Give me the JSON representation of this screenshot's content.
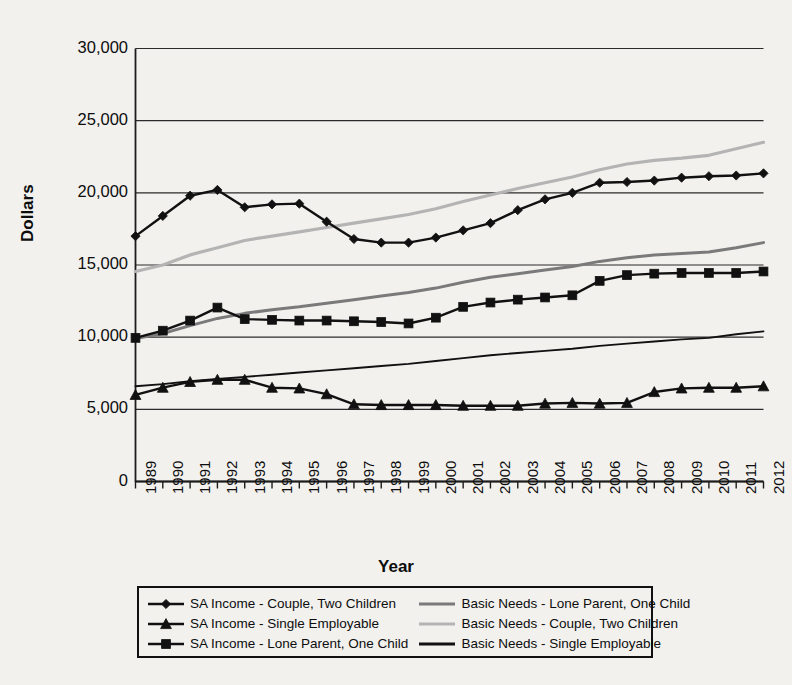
{
  "chart_data": {
    "type": "line",
    "title": "",
    "xlabel": "Year",
    "ylabel": "Dollars",
    "ylim": [
      0,
      30000
    ],
    "ytick_values": [
      30000,
      25000,
      20000,
      15000,
      10000,
      5000,
      0
    ],
    "ytick_labels": [
      "30,000",
      "25,000",
      "20,000",
      "15,000",
      "10,000",
      "5,000",
      "0"
    ],
    "grid": "horizontal",
    "legend_position": "bottom",
    "categories": [
      1989,
      1990,
      1991,
      1992,
      1993,
      1994,
      1995,
      1996,
      1997,
      1998,
      1999,
      2000,
      2001,
      2002,
      2003,
      2004,
      2005,
      2006,
      2007,
      2008,
      2009,
      2010,
      2011,
      2012
    ],
    "xtick_labels": [
      "1989",
      "1990",
      "1991",
      "1992",
      "1993",
      "1994",
      "1995",
      "1996",
      "1997",
      "1998",
      "1999",
      "2000",
      "2001",
      "2002",
      "2003",
      "2004",
      "2005",
      "2006",
      "2007",
      "2008",
      "2009",
      "2010",
      "2011",
      "2012"
    ],
    "series": [
      {
        "name": "SA Income - Couple, Two Children",
        "marker": "diamond",
        "color": "#111111",
        "width": 2.4,
        "values": [
          17000,
          18400,
          19800,
          20200,
          19000,
          19200,
          19250,
          18000,
          16800,
          16550,
          16550,
          16900,
          17400,
          17900,
          18800,
          19550,
          20000,
          20700,
          20750,
          20850,
          21050,
          21150,
          21200,
          21350
        ]
      },
      {
        "name": "SA Income - Single Employable",
        "marker": "triangle",
        "color": "#111111",
        "width": 2.4,
        "values": [
          6000,
          6500,
          6900,
          7050,
          7050,
          6500,
          6450,
          6050,
          5350,
          5300,
          5300,
          5300,
          5250,
          5250,
          5250,
          5400,
          5450,
          5400,
          5450,
          6200,
          6450,
          6500,
          6500,
          6600
        ]
      },
      {
        "name": "SA Income - Lone Parent, One Child",
        "marker": "square",
        "color": "#111111",
        "width": 2.4,
        "values": [
          9950,
          10450,
          11150,
          12050,
          11250,
          11200,
          11150,
          11150,
          11100,
          11050,
          10950,
          11350,
          12100,
          12400,
          12600,
          12750,
          12900,
          13900,
          14300,
          14400,
          14450,
          14450,
          14450,
          14550
        ]
      },
      {
        "name": "Basic Needs - Lone Parent, One Child",
        "marker": "none",
        "color": "#7a7a7a",
        "width": 3.0,
        "values": [
          9900,
          10250,
          10800,
          11300,
          11650,
          11900,
          12100,
          12350,
          12600,
          12850,
          13100,
          13400,
          13800,
          14150,
          14400,
          14650,
          14900,
          15250,
          15500,
          15700,
          15800,
          15900,
          16200,
          16550
        ]
      },
      {
        "name": "Basic Needs - Couple, Two Children",
        "marker": "none",
        "color": "#b4b4b4",
        "width": 3.2,
        "values": [
          14550,
          15000,
          15700,
          16200,
          16700,
          17000,
          17300,
          17600,
          17900,
          18200,
          18500,
          18900,
          19400,
          19850,
          20300,
          20700,
          21100,
          21600,
          22000,
          22250,
          22400,
          22600,
          23050,
          23500
        ]
      },
      {
        "name": "Basic Needs - Single Employable",
        "marker": "none",
        "color": "#111111",
        "width": 1.9,
        "values": [
          6600,
          6750,
          6950,
          7100,
          7250,
          7400,
          7550,
          7700,
          7850,
          8000,
          8150,
          8350,
          8550,
          8750,
          8900,
          9050,
          9200,
          9400,
          9550,
          9700,
          9850,
          9950,
          10200,
          10400
        ]
      }
    ]
  },
  "axis": {
    "ylabel": "Dollars",
    "xlabel": "Year"
  },
  "legend": {
    "left_column": [
      {
        "label": "SA Income - Couple, Two Children",
        "marker": "diamond",
        "color": "#111111",
        "icon": "line-diamond-marker-icon"
      },
      {
        "label": "SA Income - Single Employable",
        "marker": "triangle",
        "color": "#111111",
        "icon": "line-triangle-marker-icon"
      },
      {
        "label": "SA Income - Lone Parent, One Child",
        "marker": "square",
        "color": "#111111",
        "icon": "line-square-marker-icon"
      }
    ],
    "right_column": [
      {
        "label": "Basic Needs - Lone Parent, One Child",
        "marker": "none",
        "color": "#7a7a7a",
        "icon": "line-medium-gray-icon"
      },
      {
        "label": "Basic Needs - Couple, Two Children",
        "marker": "none",
        "color": "#b4b4b4",
        "icon": "line-light-gray-icon"
      },
      {
        "label": "Basic Needs - Single Employable",
        "marker": "none",
        "color": "#111111",
        "icon": "line-black-thin-icon"
      }
    ]
  }
}
